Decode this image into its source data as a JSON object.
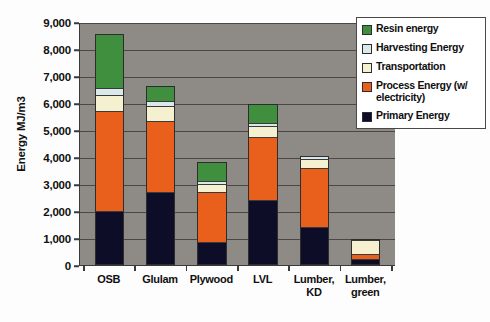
{
  "chart_data": {
    "type": "bar",
    "subtype": "stacked-bar",
    "title": "",
    "xlabel": "",
    "ylabel": "Energy MJ/m3",
    "ylim": [
      0,
      9000
    ],
    "ytick_step": 1000,
    "ytick_labels": [
      "9,000",
      "8,000",
      "7,000",
      "6,000",
      "5,000",
      "4,000",
      "3,000",
      "2,000",
      "1,000",
      "0"
    ],
    "ytick_values": [
      9000,
      8000,
      7000,
      6000,
      5000,
      4000,
      3000,
      2000,
      1000,
      0
    ],
    "grid": true,
    "grid_axis": "y",
    "legend_position": "top-right",
    "plot_background": "#8e8b86",
    "categories": [
      "OSB",
      "Glulam",
      "Plywood",
      "LVL",
      "Lumber, KD",
      "Lumber, green"
    ],
    "category_labels": [
      [
        "OSB"
      ],
      [
        "Glulam"
      ],
      [
        "Plywood"
      ],
      [
        "LVL"
      ],
      [
        "Lumber,",
        "KD"
      ],
      [
        "Lumber,",
        "green"
      ]
    ],
    "series": [
      {
        "name": "Primary Energy",
        "color": "#0d0d28",
        "values": [
          1930,
          2630,
          790,
          2350,
          1350,
          150
        ]
      },
      {
        "name": "Process Energy (w/ electricity)",
        "color": "#e8601c",
        "values": [
          3690,
          2640,
          1840,
          2320,
          2160,
          190
        ]
      },
      {
        "name": "Transportation",
        "color": "#f5f0d0",
        "values": [
          590,
          560,
          300,
          400,
          350,
          530
        ]
      },
      {
        "name": "Harvesting Energy",
        "color": "#d9e8e8",
        "values": [
          260,
          160,
          110,
          130,
          90,
          30
        ]
      },
      {
        "name": "Resin energy",
        "color": "#3f8f3f",
        "values": [
          2010,
          560,
          710,
          680,
          0,
          0
        ]
      }
    ],
    "totals": [
      8480,
      6550,
      3750,
      5880,
      3950,
      900
    ]
  },
  "legend": {
    "items": [
      {
        "label": "Resin energy",
        "color": "#3f8f3f"
      },
      {
        "label": "Harvesting Energy",
        "color": "#d9e8e8"
      },
      {
        "label": "Transportation",
        "color": "#f5f0d0"
      },
      {
        "label": "Process Energy (w/ electricity)",
        "color": "#e8601c"
      },
      {
        "label": "Primary Energy",
        "color": "#0d0d28"
      }
    ]
  }
}
